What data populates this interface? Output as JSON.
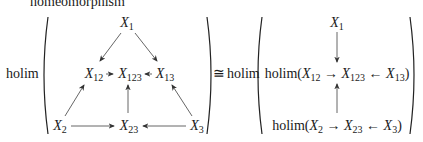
{
  "caption_fragment": "homeomorphism",
  "operator": "holim",
  "iso_symbol": "≅",
  "left_diagram": {
    "nodes": [
      {
        "id": "X1",
        "base": "X",
        "sub": "1"
      },
      {
        "id": "X12",
        "base": "X",
        "sub": "12"
      },
      {
        "id": "X123",
        "base": "X",
        "sub": "123"
      },
      {
        "id": "X13",
        "base": "X",
        "sub": "13"
      },
      {
        "id": "X2",
        "base": "X",
        "sub": "2"
      },
      {
        "id": "X23",
        "base": "X",
        "sub": "23"
      },
      {
        "id": "X3",
        "base": "X",
        "sub": "3"
      }
    ],
    "edges": [
      [
        "X1",
        "X12"
      ],
      [
        "X1",
        "X13"
      ],
      [
        "X12",
        "X123"
      ],
      [
        "X13",
        "X123"
      ],
      [
        "X2",
        "X12"
      ],
      [
        "X23",
        "X123"
      ],
      [
        "X3",
        "X13"
      ],
      [
        "X2",
        "X23"
      ],
      [
        "X3",
        "X23"
      ]
    ]
  },
  "right_diagram": {
    "top": {
      "base": "X",
      "sub": "1"
    },
    "middle": {
      "prefix": "holim(",
      "a": {
        "base": "X",
        "sub": "12"
      },
      "arrow1": "→",
      "b": {
        "base": "X",
        "sub": "123"
      },
      "arrow2": "←",
      "c": {
        "base": "X",
        "sub": "13"
      },
      "suffix": ")"
    },
    "bottom": {
      "prefix": "holim(",
      "a": {
        "base": "X",
        "sub": "2"
      },
      "arrow1": "→",
      "b": {
        "base": "X",
        "sub": "23"
      },
      "arrow2": "←",
      "c": {
        "base": "X",
        "sub": "3"
      },
      "suffix": ")"
    },
    "edges": [
      [
        "top",
        "middle"
      ],
      [
        "bottom",
        "middle"
      ]
    ]
  }
}
